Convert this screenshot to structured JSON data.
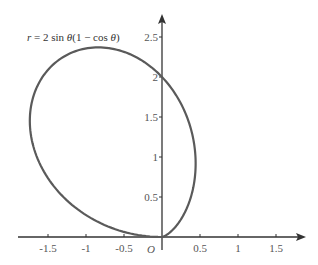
{
  "chart_data": {
    "type": "line",
    "title": "r = 2 sin θ(1 − cos θ)",
    "title_parts": {
      "r": "r",
      "eq": " = 2 sin ",
      "theta1": "θ",
      "mid": "(1 − cos ",
      "theta2": "θ",
      "close": ")"
    },
    "curve": {
      "kind": "polar",
      "equation": "r = 2*sin(theta)*(1 - cos(theta))",
      "theta_range": [
        0,
        3.14159
      ],
      "color": "#5a5a5a",
      "key_points": [
        {
          "x": 0,
          "y": 0
        },
        {
          "x": 0.43,
          "y": 1.0
        },
        {
          "x": 0,
          "y": 2.0
        },
        {
          "x": -0.8,
          "y": 2.38
        },
        {
          "x": -1.77,
          "y": 1.1
        },
        {
          "x": 0,
          "y": 0
        }
      ]
    },
    "xlabel": "",
    "ylabel": "",
    "origin_label": "O",
    "x_ticks": [
      {
        "value": -1.5,
        "label": "-1.5"
      },
      {
        "value": -1,
        "label": "-1"
      },
      {
        "value": -0.5,
        "label": "-0.5"
      },
      {
        "value": 0.5,
        "label": "0.5"
      },
      {
        "value": 1,
        "label": "1"
      },
      {
        "value": 1.5,
        "label": "1.5"
      }
    ],
    "y_ticks": [
      {
        "value": 0.5,
        "label": "0.5"
      },
      {
        "value": 1,
        "label": "1"
      },
      {
        "value": 1.5,
        "label": "1.5"
      },
      {
        "value": 2,
        "label": "2"
      },
      {
        "value": 2.5,
        "label": "2.5"
      }
    ],
    "xlim": [
      -2.0,
      1.85
    ],
    "ylim": [
      -0.2,
      2.75
    ],
    "grid": false,
    "legend": null,
    "axis_color": "#333333"
  }
}
